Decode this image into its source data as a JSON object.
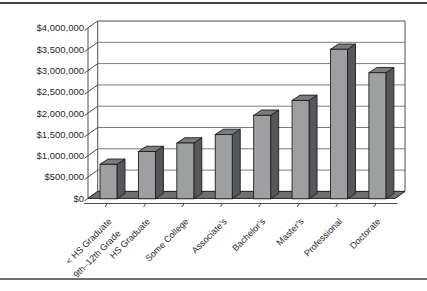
{
  "page": {
    "background": "#ffffff",
    "top_rule_color": "#454545",
    "bottom_rule_color": "#6e6e6e"
  },
  "chart_data": {
    "type": "bar",
    "projection": "3d-column",
    "title": "",
    "xlabel": "",
    "ylabel": "",
    "grid": true,
    "legend": false,
    "ylim": [
      0,
      4000000
    ],
    "y_step": 500000,
    "y_tick_labels": [
      "$4,000,000",
      "$3,500,000",
      "$3,000,000",
      "$2,500,000",
      "$2,000,000",
      "$1,500,000",
      "$1,000,000",
      "$500,000",
      "$0"
    ],
    "categories": [
      "< HS Graduate\n9th–12th Grade",
      "HS Graduate",
      "Some College",
      "Associate’s",
      "Bachelor’s",
      "Master’s",
      "Professional",
      "Doctorate"
    ],
    "values": [
      800000,
      1100000,
      1300000,
      1500000,
      1950000,
      2300000,
      3500000,
      2950000
    ],
    "colors": {
      "bar_front": "#9d9fa0",
      "bar_side": "#55575a",
      "bar_top": "#7a7c7e",
      "bar_outline": "#1e1e1e",
      "floor": "#6f7072",
      "floor_outline": "#262626",
      "wall_border": "#4f4f4f",
      "gridline": "#7d7d7d",
      "text": "#2a2a2a"
    }
  }
}
